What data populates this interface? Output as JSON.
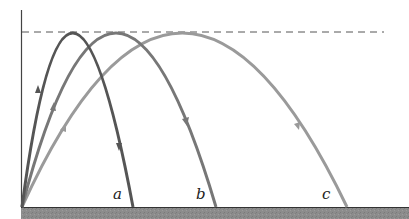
{
  "diagram": {
    "labels": {
      "a": "a",
      "b": "b",
      "c": "c"
    },
    "max_height_line": "dashed",
    "colors": {
      "trajectory_a": "#555555",
      "trajectory_b": "#777777",
      "trajectory_c": "#9a9a9a",
      "ground": "#8c8c8c",
      "axis": "#333333",
      "dashed_line": "#555555"
    },
    "trajectories": [
      {
        "id": "a",
        "launch_x": 22,
        "peak_x": 68,
        "land_x": 133,
        "peak_y": 33
      },
      {
        "id": "b",
        "launch_x": 22,
        "peak_x": 113,
        "land_x": 216,
        "peak_y": 33
      },
      {
        "id": "c",
        "launch_x": 22,
        "peak_x": 180,
        "land_x": 347,
        "peak_y": 33
      }
    ]
  }
}
